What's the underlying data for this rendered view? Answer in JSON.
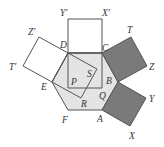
{
  "diagram": {
    "colors": {
      "hexagon_fill": "#e4e4e4",
      "shaded_square_fill": "#7a7a7a",
      "stroke": "#555555"
    },
    "hexagon": {
      "vertices": [
        "A",
        "B",
        "C",
        "D",
        "E",
        "F"
      ]
    },
    "squares": [
      {
        "name": "square-DC-outer",
        "vertices": [
          "D",
          "C",
          "X'",
          "Y'"
        ],
        "shaded": false
      },
      {
        "name": "square-DC-inner",
        "vertices": [
          "D",
          "C",
          "Q",
          "P"
        ],
        "shaded": false
      },
      {
        "name": "square-DE-outer",
        "vertices": [
          "D",
          "E",
          "T'",
          "Z'"
        ],
        "shaded": false
      },
      {
        "name": "square-DE-inner",
        "vertices": [
          "D",
          "E",
          "R",
          "S"
        ],
        "shaded": false
      },
      {
        "name": "square-CB",
        "vertices": [
          "C",
          "B",
          "Z",
          "T"
        ],
        "shaded": true
      },
      {
        "name": "square-BA",
        "vertices": [
          "B",
          "A",
          "X",
          "Y"
        ],
        "shaded": true
      }
    ],
    "labels": {
      "A": "A",
      "B": "B",
      "C": "C",
      "D": "D",
      "E": "E",
      "F": "F",
      "P": "P",
      "Q": "Q",
      "R": "R",
      "S": "S",
      "T": "T",
      "X": "X",
      "Y": "Y",
      "Z": "Z",
      "Tp": "T′",
      "Xp": "X′",
      "Yp": "Y′",
      "Zp": "Z′"
    }
  }
}
